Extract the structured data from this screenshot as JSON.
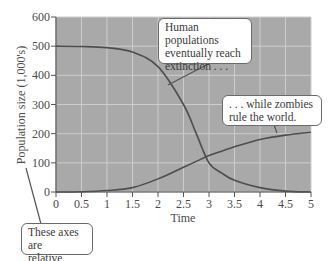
{
  "chart_data": {
    "type": "line",
    "title": "",
    "xlabel": "Time",
    "ylabel": "Population size (1,000's)",
    "xlim": [
      0,
      5
    ],
    "ylim": [
      0,
      600
    ],
    "grid": true,
    "x_ticks": [
      "0",
      "0.5",
      "1",
      "1.5",
      "2",
      "2.5",
      "3",
      "3.5",
      "4",
      "4.5",
      "5"
    ],
    "y_ticks": [
      "0",
      "100",
      "200",
      "300",
      "400",
      "500",
      "600"
    ],
    "x": [
      0,
      0.5,
      1,
      1.5,
      2,
      2.5,
      2.75,
      3,
      3.25,
      3.5,
      4,
      4.5,
      5
    ],
    "series": [
      {
        "name": "Humans",
        "values": [
          500,
          499,
          495,
          480,
          430,
          300,
          200,
          100,
          65,
          40,
          15,
          3,
          0
        ]
      },
      {
        "name": "Zombies",
        "values": [
          0,
          1,
          5,
          15,
          45,
          85,
          105,
          125,
          140,
          155,
          180,
          195,
          205
        ]
      }
    ],
    "annotations": [
      {
        "text": "Human populations\neventually reach\nextinction . . .",
        "points_to": "Humans"
      },
      {
        "text": ". . . while zombies\nrule the world.",
        "points_to": "Zombies"
      },
      {
        "text": "These axes are\nrelative valves",
        "points_to": "axes"
      }
    ],
    "legend": "none"
  },
  "colors": {
    "plot_background": "#a9a9a9",
    "grid": "#cdcdcd",
    "curve": "#4e4e4e",
    "axis": "#555555"
  },
  "labels": {
    "xlabel": "Time",
    "ylabel": "Population size (1,000's)",
    "callout_humans": "Human populations\neventually reach\nextinction . . .",
    "callout_zombies": ". . . while zombies\nrule the world.",
    "callout_axes": "These axes are\nrelative valves"
  }
}
